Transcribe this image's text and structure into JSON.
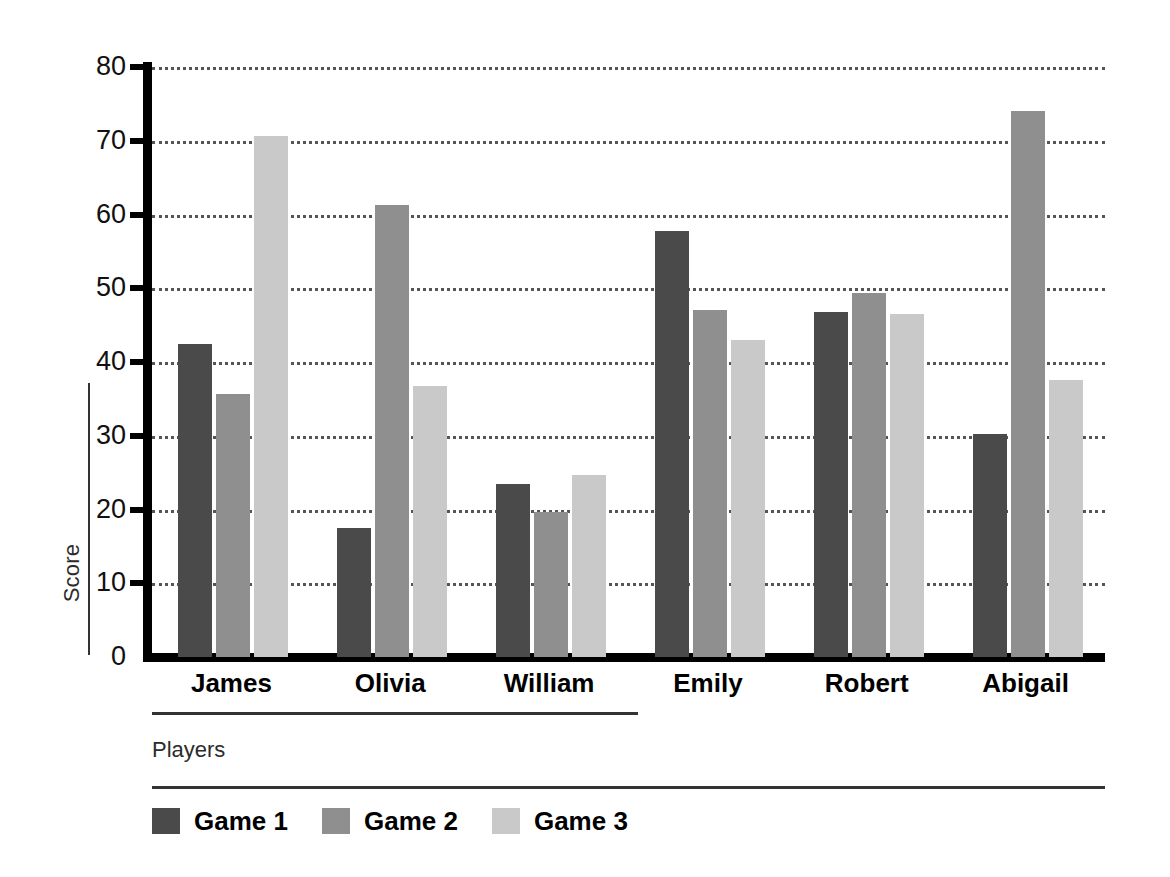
{
  "chart_data": {
    "type": "bar",
    "title": "",
    "xlabel": "Players",
    "ylabel": "Score",
    "categories": [
      "James",
      "Olivia",
      "William",
      "Emily",
      "Robert",
      "Abigail"
    ],
    "series": [
      {
        "name": "Game 1",
        "color": "#4a4a4a",
        "values": [
          42.5,
          17.5,
          23.5,
          57.7,
          46.8,
          30.3
        ]
      },
      {
        "name": "Game 2",
        "color": "#8f8f8f",
        "values": [
          35.6,
          61.3,
          19.6,
          47.0,
          49.3,
          74.0
        ]
      },
      {
        "name": "Game 3",
        "color": "#c9c9c9",
        "values": [
          70.7,
          36.8,
          24.7,
          43.0,
          46.5,
          37.6
        ]
      }
    ],
    "ylim": [
      0,
      80
    ],
    "yticks": [
      0,
      10,
      20,
      30,
      40,
      50,
      60,
      70,
      80
    ],
    "ytick_labels": [
      "0",
      "10",
      "20",
      "30",
      "40",
      "50",
      "60",
      "70",
      "80"
    ],
    "grid": true,
    "grid_style": "dotted",
    "legend_position": "bottom-left",
    "legend_entries": [
      "Game 1",
      "Game 2",
      "Game 3"
    ]
  }
}
